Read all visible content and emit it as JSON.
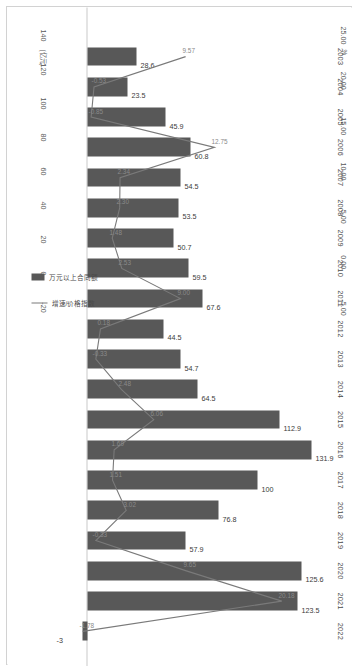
{
  "chart_data": {
    "type": "bar",
    "title": "",
    "orientation": "rotated-90",
    "categories": [
      "2003",
      "2004",
      "2005",
      "2006",
      "2007",
      "2008",
      "2009",
      "2010",
      "2011",
      "2012",
      "2013",
      "2014",
      "2015",
      "2016",
      "2017",
      "2018",
      "2019",
      "2020",
      "2021",
      "2022"
    ],
    "series": [
      {
        "name": "万元以上合同额",
        "type": "bar",
        "unit": "亿元",
        "axis": "primary",
        "values": [
          28.6,
          23.5,
          45.9,
          60.8,
          54.5,
          53.5,
          50.7,
          59.5,
          67.6,
          44.5,
          54.7,
          64.5,
          112.9,
          131.9,
          100,
          76.8,
          57.9,
          125.6,
          123.5,
          -3.0
        ],
        "color": "#585858"
      },
      {
        "name": "增速/价格指数",
        "type": "line",
        "unit": "%",
        "axis": "secondary",
        "values": [
          9.57,
          -0.53,
          -0.85,
          12.75,
          2.34,
          2.3,
          1.48,
          2.53,
          9.0,
          0.18,
          -0.33,
          2.48,
          6.06,
          1.69,
          1.51,
          3.02,
          -0.33,
          9.65,
          20.18,
          -1.78
        ],
        "color": "#7a7a7a"
      }
    ],
    "primary_axis": {
      "label": "(亿元)",
      "unit": "亿元",
      "ticks": [
        "-20",
        "0",
        "20",
        "40",
        "60",
        "80",
        "100",
        "120",
        "140"
      ],
      "min": -20,
      "max": 140
    },
    "secondary_axis": {
      "label": "%",
      "unit": "%",
      "ticks": [
        "-5.00",
        "0.00",
        "5.00",
        "10.00",
        "15.00",
        "20.00",
        "25.00"
      ],
      "min": -5,
      "max": 25
    },
    "legend": {
      "position": "left",
      "entries": [
        {
          "label": "万元以上合同额",
          "marker": "bar"
        },
        {
          "label": "增速/价格指数",
          "marker": "line"
        }
      ]
    },
    "grid": false
  }
}
